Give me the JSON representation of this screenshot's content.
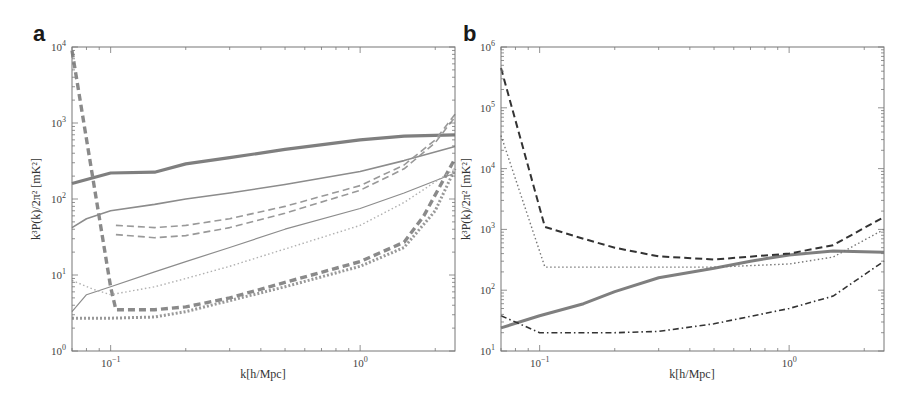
{
  "panels": [
    {
      "letter": "a",
      "xlabel": "k[h/Mpc]",
      "ylabel": "k³P(k)/2π² [mK²]"
    },
    {
      "letter": "b",
      "xlabel": "k[h/Mpc]",
      "ylabel": "k³P(k)/2π² [mK²]"
    }
  ],
  "chart_data": [
    {
      "type": "line",
      "panel": "a",
      "title": "",
      "xlabel": "k[h/Mpc]",
      "ylabel": "k^3P(k)/2π^2 [mK^2]",
      "xscale": "log",
      "yscale": "log",
      "xlim": [
        0.07,
        2.4
      ],
      "ylim": [
        1,
        10000
      ],
      "xticks": [
        "10^-1",
        "10^0"
      ],
      "yticks": [
        "10^0",
        "10^1",
        "10^2",
        "10^3",
        "10^4"
      ],
      "grid": false,
      "legend": null,
      "series": [
        {
          "name": "thick solid",
          "style": "solid",
          "width": 3.2,
          "color": "#7f7f7f",
          "x": [
            0.07,
            0.1,
            0.15,
            0.2,
            0.3,
            0.5,
            1.0,
            1.5,
            2.4
          ],
          "y": [
            160,
            220,
            225,
            290,
            350,
            450,
            600,
            670,
            700
          ]
        },
        {
          "name": "thin solid upper",
          "style": "solid",
          "width": 1.6,
          "color": "#8c8c8c",
          "x": [
            0.07,
            0.08,
            0.1,
            0.15,
            0.2,
            0.3,
            0.5,
            1.0,
            1.5,
            2.4
          ],
          "y": [
            42,
            55,
            70,
            85,
            100,
            120,
            155,
            230,
            320,
            490
          ]
        },
        {
          "name": "thin solid lower",
          "style": "solid",
          "width": 1.2,
          "color": "#8c8c8c",
          "x": [
            0.07,
            0.08,
            0.1,
            0.15,
            0.2,
            0.3,
            0.5,
            1.0,
            1.5,
            2.4
          ],
          "y": [
            3.3,
            5.5,
            7,
            11,
            15,
            23,
            40,
            75,
            120,
            220
          ]
        },
        {
          "name": "thick dashed",
          "style": "dashed",
          "width": 3.4,
          "color": "#8a8a8a",
          "x": [
            0.07,
            0.1,
            0.105,
            0.15,
            0.2,
            0.3,
            0.5,
            1.0,
            1.5,
            1.8,
            2.4
          ],
          "y": [
            9000,
            7,
            3.5,
            3.5,
            3.8,
            5,
            8,
            15,
            27,
            60,
            340
          ]
        },
        {
          "name": "thin dashed upper",
          "style": "dashed",
          "width": 1.6,
          "color": "#999999",
          "x": [
            0.105,
            0.15,
            0.2,
            0.3,
            0.5,
            1.0,
            1.5,
            2.0,
            2.4
          ],
          "y": [
            45,
            42,
            45,
            55,
            80,
            150,
            280,
            600,
            1300
          ]
        },
        {
          "name": "thin dashed lower",
          "style": "dashed",
          "width": 1.6,
          "color": "#999999",
          "x": [
            0.105,
            0.15,
            0.2,
            0.3,
            0.5,
            1.0,
            1.5,
            2.0,
            2.4
          ],
          "y": [
            34,
            31,
            33,
            42,
            65,
            130,
            250,
            550,
            1200
          ]
        },
        {
          "name": "thick dotted",
          "style": "dotted",
          "width": 3.0,
          "color": "#999999",
          "x": [
            0.07,
            0.1,
            0.15,
            0.2,
            0.3,
            0.5,
            1.0,
            1.5,
            2.0,
            2.4
          ],
          "y": [
            2.7,
            2.7,
            2.8,
            3.3,
            4.6,
            7,
            13,
            23,
            70,
            250
          ]
        },
        {
          "name": "thin dotted",
          "style": "dotted",
          "width": 1.4,
          "color": "#b0b0b0",
          "x": [
            0.07,
            0.085,
            0.1,
            0.15,
            0.2,
            0.3,
            0.5,
            1.0,
            1.5,
            2.4
          ],
          "y": [
            8.5,
            6.5,
            5.5,
            7,
            9,
            13,
            22,
            45,
            90,
            250
          ]
        }
      ]
    },
    {
      "type": "line",
      "panel": "b",
      "title": "",
      "xlabel": "k[h/Mpc]",
      "ylabel": "k^3P(k)/2π^2 [mK^2]",
      "xscale": "log",
      "yscale": "log",
      "xlim": [
        0.07,
        2.4
      ],
      "ylim": [
        10,
        1000000
      ],
      "xticks": [
        "10^-1",
        "10^0"
      ],
      "yticks": [
        "10^1",
        "10^2",
        "10^3",
        "10^4",
        "10^5",
        "10^6"
      ],
      "grid": false,
      "legend": null,
      "series": [
        {
          "name": "thick solid",
          "style": "solid",
          "width": 3.0,
          "color": "#7f7f7f",
          "x": [
            0.07,
            0.1,
            0.15,
            0.2,
            0.3,
            0.5,
            0.7,
            1.0,
            1.5,
            2.4
          ],
          "y": [
            24,
            38,
            60,
            95,
            160,
            230,
            300,
            380,
            440,
            420
          ]
        },
        {
          "name": "black dashed",
          "style": "dashed",
          "width": 2.0,
          "color": "#333333",
          "x": [
            0.07,
            0.105,
            0.15,
            0.2,
            0.3,
            0.5,
            1.0,
            1.5,
            2.4
          ],
          "y": [
            450000,
            1100,
            700,
            500,
            360,
            320,
            400,
            550,
            1600
          ]
        },
        {
          "name": "dotted",
          "style": "dotted",
          "width": 1.4,
          "color": "#777777",
          "x": [
            0.07,
            0.105,
            0.2,
            0.5,
            1.0,
            1.5,
            2.4
          ],
          "y": [
            35000,
            240,
            240,
            240,
            270,
            350,
            1000
          ]
        },
        {
          "name": "dash-dot",
          "style": "dashdot",
          "width": 1.6,
          "color": "#333333",
          "x": [
            0.07,
            0.1,
            0.15,
            0.2,
            0.3,
            0.5,
            1.0,
            1.5,
            2.4
          ],
          "y": [
            38,
            20,
            20,
            20,
            21,
            28,
            50,
            80,
            300
          ]
        }
      ]
    }
  ]
}
